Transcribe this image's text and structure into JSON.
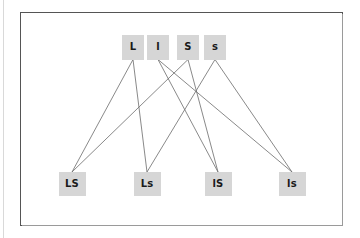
{
  "figure": {
    "type": "bipartite-diagram",
    "frame": {
      "border_color": "#555555",
      "background": "#ffffff"
    },
    "node_style": {
      "fill": "#d6d6d6",
      "text_color": "#1a1a1a"
    },
    "edge_color": "#6b6b6b"
  },
  "chart_data": {
    "type": "diagram",
    "title": "",
    "layout": "two-row bipartite graph, 4 parent nodes on top, 4 child nodes on bottom",
    "top_nodes": [
      {
        "id": "L",
        "label": "L",
        "x": 133,
        "y": 47
      },
      {
        "id": "l",
        "label": "l",
        "x": 158,
        "y": 47
      },
      {
        "id": "S",
        "label": "S",
        "x": 188,
        "y": 47
      },
      {
        "id": "s",
        "label": "s",
        "x": 215,
        "y": 47
      }
    ],
    "bottom_nodes": [
      {
        "id": "LS",
        "label": "LS",
        "x": 72,
        "y": 184
      },
      {
        "id": "Ls",
        "label": "Ls",
        "x": 147,
        "y": 184
      },
      {
        "id": "lS",
        "label": "lS",
        "x": 218,
        "y": 184
      },
      {
        "id": "ls",
        "label": "ls",
        "x": 292,
        "y": 184
      }
    ],
    "edges": [
      {
        "from": "L",
        "to": "LS"
      },
      {
        "from": "L",
        "to": "Ls"
      },
      {
        "from": "l",
        "to": "lS"
      },
      {
        "from": "l",
        "to": "ls"
      },
      {
        "from": "S",
        "to": "LS"
      },
      {
        "from": "S",
        "to": "lS"
      },
      {
        "from": "s",
        "to": "Ls"
      },
      {
        "from": "s",
        "to": "ls"
      }
    ]
  }
}
